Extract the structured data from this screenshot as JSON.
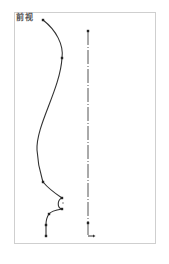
{
  "view": {
    "label": "前视",
    "frame_color": "#cfcfcf",
    "stroke_color": "#333333",
    "axis_color": "#555555"
  },
  "profile_curve": {
    "points": [
      [
        43,
        20
      ],
      [
        62,
        58
      ],
      [
        43,
        182
      ],
      [
        62,
        198
      ],
      [
        62,
        209
      ],
      [
        49,
        214
      ],
      [
        46,
        225
      ],
      [
        46,
        236
      ]
    ],
    "path": "M43,20 C56,30 64,45 62,58 C60,90 36,125 37,150 C38,168 42,178 43,182 C48,188 56,194 62,198 C57,200 57,208 62,209 C56,210 51,211 49,214 C46,218 46,222 46,225 L46,236",
    "bump_center": [
      63,
      203
    ]
  },
  "axis_line": {
    "x": 88,
    "y_start": 31,
    "y_end": 236,
    "dot_points": [
      [
        88,
        31
      ],
      [
        88,
        223
      ]
    ],
    "end_marker": [
      [
        88,
        236
      ],
      [
        93,
        236
      ]
    ]
  }
}
